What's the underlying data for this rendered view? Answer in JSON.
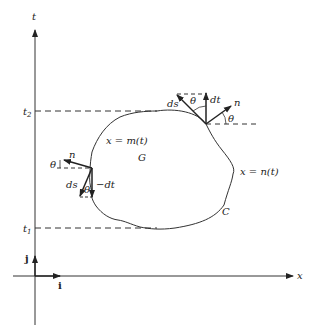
{
  "diagram": {
    "axes": {
      "vertical_label": "t",
      "horizontal_label": "x",
      "unit_i": "i",
      "unit_j": "j"
    },
    "levels": {
      "t2": "t",
      "t2_sub": "2",
      "t1": "t",
      "t1_sub": "1"
    },
    "region": {
      "label": "G",
      "boundary_label": "C",
      "left_curve": "x = m(t)",
      "right_curve": "x = n(t)"
    },
    "right_point": {
      "normal": "n",
      "tangent": "ds",
      "dt": "dt",
      "angle_top": "θ",
      "angle_right": "θ"
    },
    "left_point": {
      "normal": "n",
      "tangent": "ds",
      "dt": "−dt",
      "angle_left": "θ",
      "angle_bottom": "θ"
    },
    "colors": {
      "ink": "#222222",
      "background": "#ffffff"
    }
  }
}
